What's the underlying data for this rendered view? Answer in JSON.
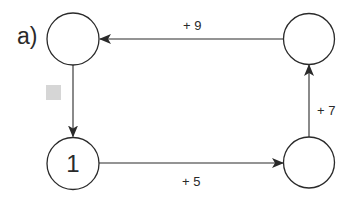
{
  "part_label": "a)",
  "nodes": [
    {
      "id": "top-left",
      "value": ""
    },
    {
      "id": "top-right",
      "value": ""
    },
    {
      "id": "bottom-right",
      "value": ""
    },
    {
      "id": "bottom-left",
      "value": "1"
    }
  ],
  "edges": [
    {
      "from": "bottom-left",
      "to": "bottom-right",
      "label": "+ 5"
    },
    {
      "from": "bottom-right",
      "to": "top-right",
      "label": "+ 7"
    },
    {
      "from": "top-right",
      "to": "top-left",
      "label": "+ 9"
    },
    {
      "from": "top-left",
      "to": "bottom-left",
      "label": ""
    }
  ],
  "colors": {
    "stroke": "#2a2a2a",
    "marker_box": "#d6d6d6"
  }
}
